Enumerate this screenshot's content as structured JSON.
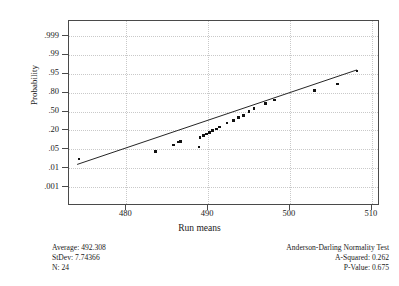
{
  "chart_data": {
    "type": "scatter",
    "title": "",
    "xlabel": "Run means",
    "ylabel": "Probability",
    "xlim": [
      473.0,
      511.0
    ],
    "xticks": [
      480,
      490,
      500,
      510
    ],
    "xticklabels": [
      "480",
      "490",
      "500",
      "510"
    ],
    "yticklabels": [
      ".999",
      ".99",
      ".95",
      ".80",
      ".50",
      ".20",
      ".05",
      ".01",
      ".001"
    ],
    "yticks": [
      0.999,
      0.99,
      0.95,
      0.8,
      0.5,
      0.2,
      0.05,
      0.01,
      0.001
    ],
    "grid": true,
    "legend": null,
    "series": [
      {
        "name": "Run means (normal score plot)",
        "x": [
          474.2,
          483.6,
          485.8,
          486.3,
          486.6,
          488.9,
          489.0,
          489.4,
          489.8,
          490.2,
          490.5,
          491.0,
          491.4,
          492.3,
          493.1,
          493.7,
          494.3,
          495.0,
          495.6,
          497.0,
          498.1,
          503.0,
          505.8,
          508.2
        ],
        "y": [
          0.022,
          0.042,
          0.069,
          0.088,
          0.09,
          0.06,
          0.12,
          0.14,
          0.155,
          0.175,
          0.195,
          0.215,
          0.24,
          0.3,
          0.345,
          0.395,
          0.43,
          0.5,
          0.56,
          0.64,
          0.7,
          0.83,
          0.89,
          0.96
        ]
      }
    ],
    "fit_line": {
      "name": "normal fit reference line",
      "x": [
        474.0,
        508.4
      ],
      "y": [
        0.012,
        0.962
      ]
    }
  },
  "stats_left": {
    "average_label": "Average: 492.308",
    "stdev_label": "StDev: 7.74366",
    "n_label": "N: 24"
  },
  "stats_right": {
    "test_title": "Anderson-Darling Normality Test",
    "a_squared_label": "A-Squared: 0.262",
    "p_value_label": "P-Value:   0.675"
  },
  "colors": {
    "axis": "#4a4a4a",
    "grid": "#c9c9c9",
    "point": "#111111",
    "line": "#222222",
    "text": "#1a1a1a",
    "background": "#ffffff"
  }
}
